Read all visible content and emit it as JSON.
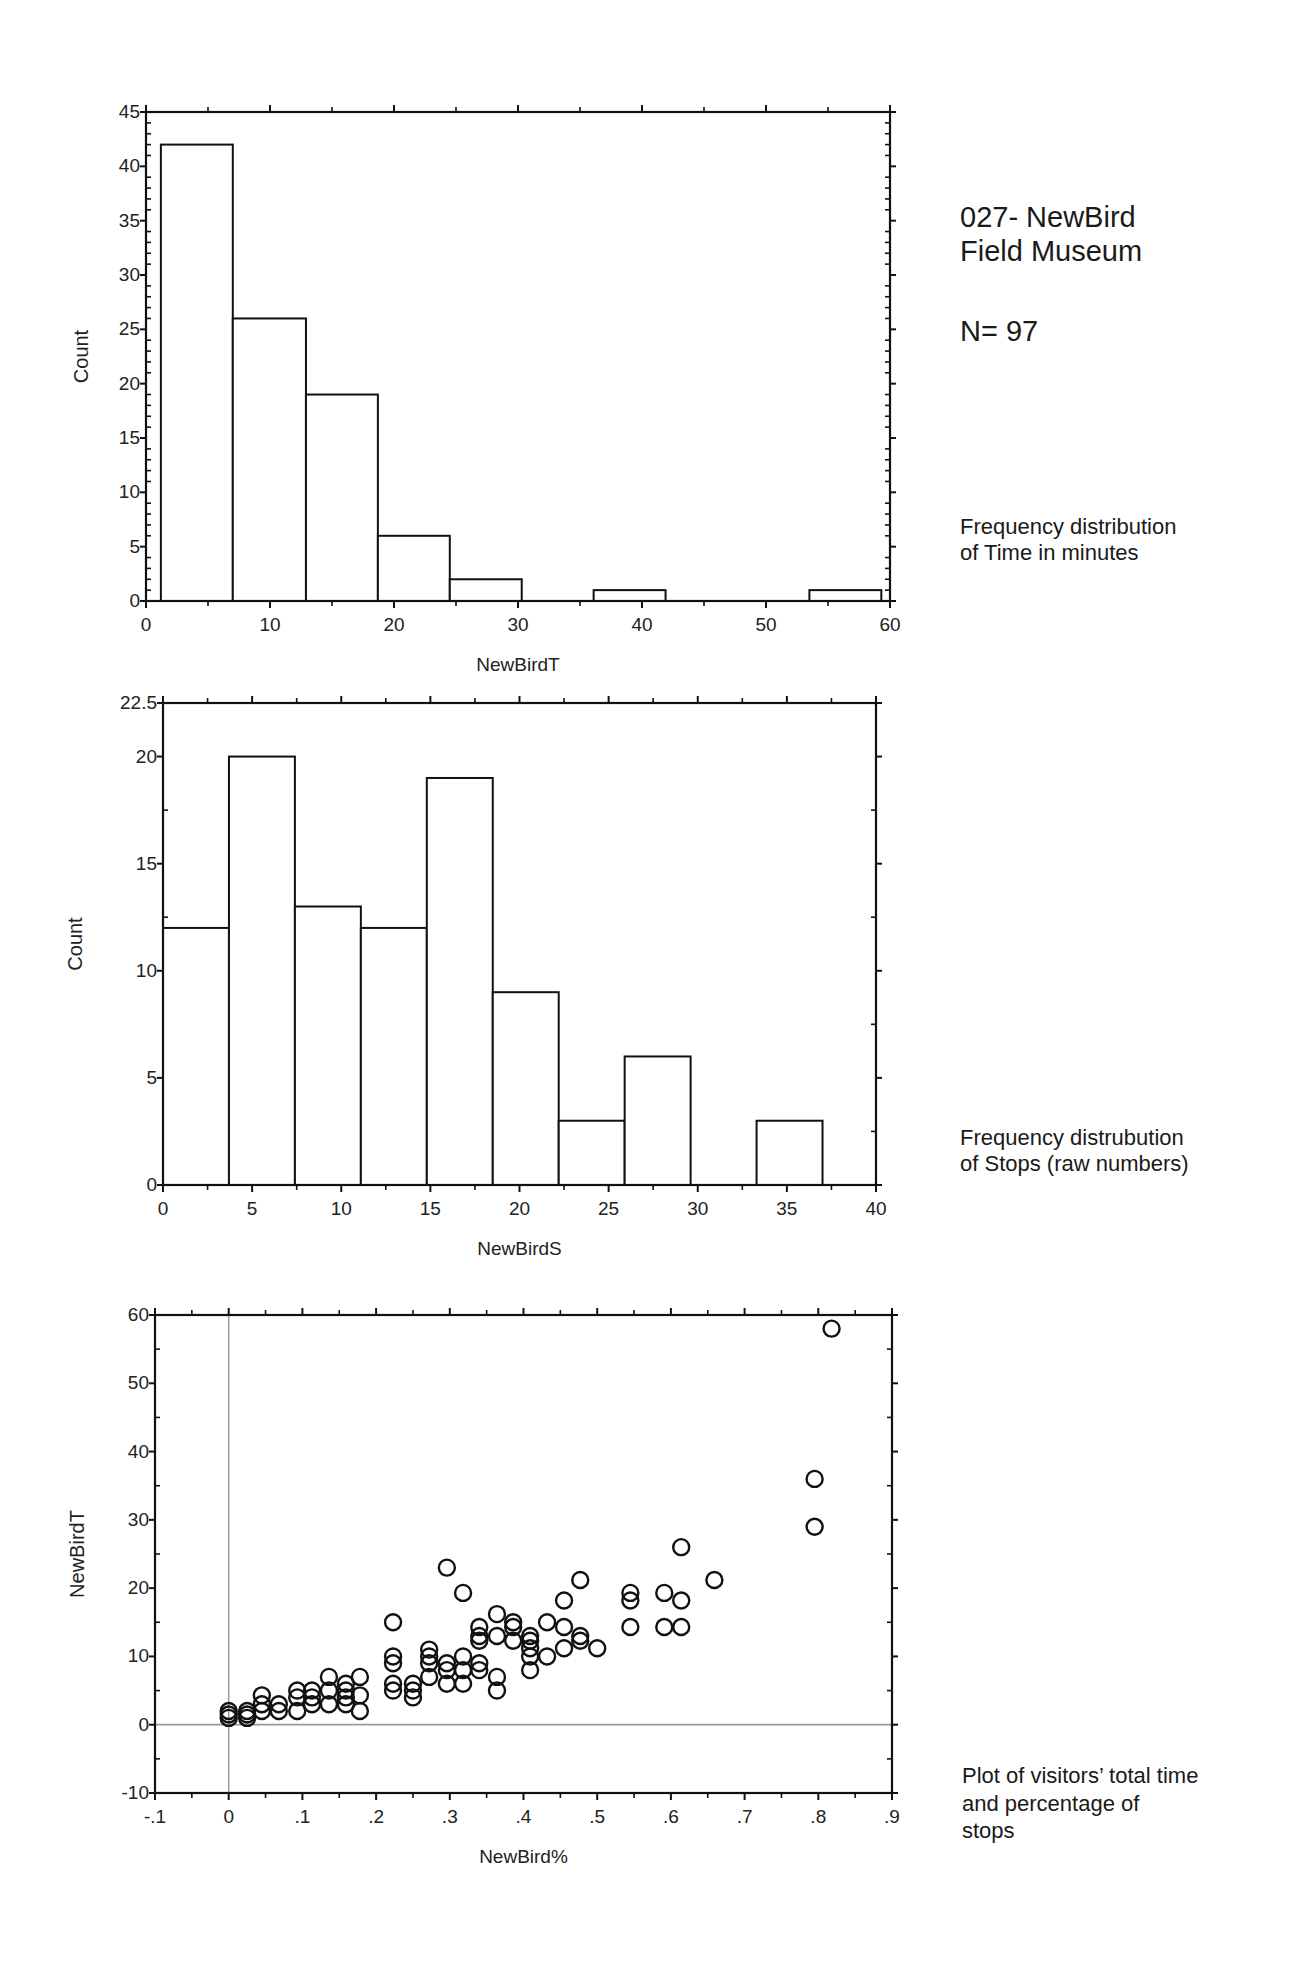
{
  "header": {
    "title_line1": "027- NewBird",
    "title_line2": "Field Museum",
    "n_label": "N= 97"
  },
  "captions": {
    "chart1_line1": "Frequency distribution",
    "chart1_line2": "of Time in minutes",
    "chart2_line1": "Frequency distrubution",
    "chart2_line2": "of Stops (raw numbers)",
    "chart3_line1": "Plot of visitors’ total time",
    "chart3_line2": "and percentage of",
    "chart3_line3": "stops"
  },
  "colors": {
    "axis": "#111111",
    "bar_fill": "#ffffff",
    "bar_stroke": "#111111",
    "ref_line": "#9a9a9a",
    "marker": "#111111"
  },
  "chart_data": [
    {
      "type": "bar",
      "subtype": "histogram",
      "title": "Frequency distribution of Time in minutes",
      "xlabel": "NewBirdT",
      "ylabel": "Count",
      "xlim": [
        0,
        60
      ],
      "ylim": [
        0,
        45
      ],
      "xticks": [
        0,
        10,
        20,
        30,
        40,
        50,
        60
      ],
      "yticks": [
        0,
        5,
        10,
        15,
        20,
        25,
        30,
        35,
        40,
        45
      ],
      "bin_edges": [
        1.2,
        7.0,
        12.9,
        18.7,
        24.5,
        30.3,
        36.1,
        41.9,
        47.7,
        53.5,
        59.3
      ],
      "values": [
        42,
        26,
        19,
        6,
        2,
        0,
        1,
        0,
        0,
        1
      ],
      "grid": false
    },
    {
      "type": "bar",
      "subtype": "histogram",
      "title": "Frequency distrubution of Stops (raw numbers)",
      "xlabel": "NewBirdS",
      "ylabel": "Count",
      "xlim": [
        0,
        40
      ],
      "ylim": [
        0,
        22.5
      ],
      "xticks": [
        0,
        5,
        10,
        15,
        20,
        25,
        30,
        35,
        40
      ],
      "yticks": [
        0,
        5,
        10,
        15,
        20,
        22.5
      ],
      "bin_edges": [
        0,
        3.7,
        7.4,
        11.1,
        14.8,
        18.5,
        22.2,
        25.9,
        29.6,
        33.3,
        37.0
      ],
      "values": [
        12,
        20,
        13,
        12,
        19,
        9,
        3,
        6,
        0,
        3
      ],
      "grid": false
    },
    {
      "type": "scatter",
      "title": "Plot of visitors’ total time and percentage of stops",
      "xlabel": "NewBird%",
      "ylabel": "NewBirdT",
      "xlim": [
        -0.1,
        0.9
      ],
      "ylim": [
        -10,
        60
      ],
      "xticks": [
        -0.1,
        0,
        0.1,
        0.2,
        0.3,
        0.4,
        0.5,
        0.6,
        0.7,
        0.8,
        0.9
      ],
      "xtick_labels": [
        "-.1",
        "0",
        ".1",
        ".2",
        ".3",
        ".4",
        ".5",
        ".6",
        ".7",
        ".8",
        ".9"
      ],
      "yticks": [
        -10,
        0,
        10,
        20,
        30,
        40,
        50,
        60
      ],
      "reference_lines": {
        "x": 0,
        "y": 0
      },
      "marker": "open-circle",
      "points": [
        [
          0.0,
          1
        ],
        [
          0.0,
          1.5
        ],
        [
          0.0,
          2
        ],
        [
          0.025,
          1
        ],
        [
          0.025,
          1.5
        ],
        [
          0.025,
          2
        ],
        [
          0.045,
          2
        ],
        [
          0.045,
          3
        ],
        [
          0.045,
          4.3
        ],
        [
          0.068,
          2
        ],
        [
          0.068,
          3
        ],
        [
          0.093,
          2
        ],
        [
          0.093,
          4
        ],
        [
          0.093,
          5
        ],
        [
          0.113,
          3
        ],
        [
          0.113,
          4
        ],
        [
          0.113,
          5
        ],
        [
          0.136,
          3
        ],
        [
          0.136,
          5
        ],
        [
          0.136,
          7
        ],
        [
          0.159,
          3
        ],
        [
          0.159,
          4
        ],
        [
          0.159,
          5
        ],
        [
          0.159,
          6
        ],
        [
          0.178,
          2
        ],
        [
          0.178,
          4.3
        ],
        [
          0.178,
          7
        ],
        [
          0.223,
          5
        ],
        [
          0.223,
          6
        ],
        [
          0.223,
          9
        ],
        [
          0.223,
          10
        ],
        [
          0.223,
          15
        ],
        [
          0.25,
          4
        ],
        [
          0.25,
          5
        ],
        [
          0.25,
          6
        ],
        [
          0.272,
          7
        ],
        [
          0.272,
          9
        ],
        [
          0.272,
          10
        ],
        [
          0.272,
          11
        ],
        [
          0.296,
          6
        ],
        [
          0.296,
          8
        ],
        [
          0.296,
          9
        ],
        [
          0.296,
          23
        ],
        [
          0.318,
          6
        ],
        [
          0.318,
          8
        ],
        [
          0.318,
          10
        ],
        [
          0.318,
          19.3
        ],
        [
          0.34,
          8
        ],
        [
          0.34,
          9
        ],
        [
          0.34,
          12.3
        ],
        [
          0.34,
          13
        ],
        [
          0.34,
          14.3
        ],
        [
          0.364,
          5
        ],
        [
          0.364,
          7
        ],
        [
          0.364,
          13
        ],
        [
          0.364,
          16.2
        ],
        [
          0.386,
          12.3
        ],
        [
          0.386,
          14.3
        ],
        [
          0.386,
          15
        ],
        [
          0.409,
          8
        ],
        [
          0.409,
          10
        ],
        [
          0.409,
          11.2
        ],
        [
          0.409,
          12.3
        ],
        [
          0.409,
          13
        ],
        [
          0.432,
          10
        ],
        [
          0.432,
          15
        ],
        [
          0.455,
          11.2
        ],
        [
          0.455,
          14.3
        ],
        [
          0.455,
          18.2
        ],
        [
          0.477,
          12.3
        ],
        [
          0.477,
          13
        ],
        [
          0.477,
          21.2
        ],
        [
          0.5,
          11.2
        ],
        [
          0.545,
          14.3
        ],
        [
          0.545,
          18.2
        ],
        [
          0.545,
          19.3
        ],
        [
          0.591,
          14.3
        ],
        [
          0.591,
          19.3
        ],
        [
          0.614,
          14.3
        ],
        [
          0.614,
          18.2
        ],
        [
          0.614,
          26
        ],
        [
          0.659,
          21.2
        ],
        [
          0.795,
          29
        ],
        [
          0.795,
          36
        ],
        [
          0.818,
          58
        ]
      ],
      "grid": false
    }
  ]
}
